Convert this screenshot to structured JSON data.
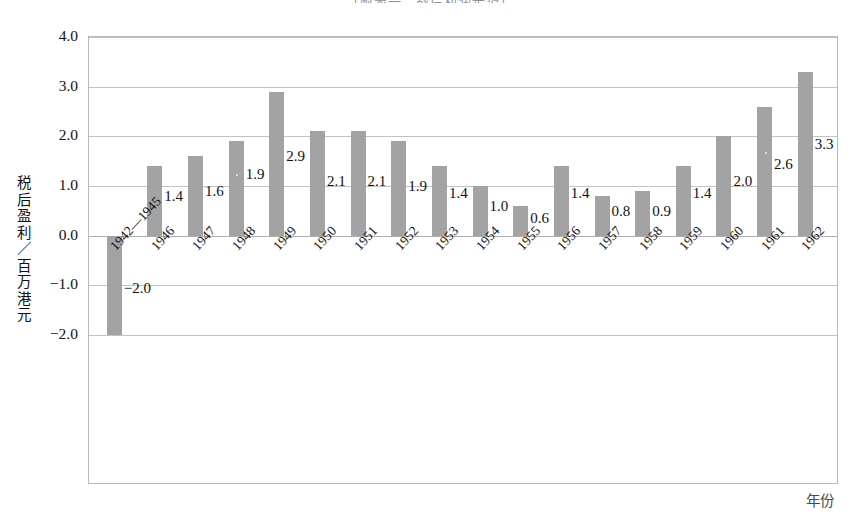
{
  "chart_data": {
    "type": "bar",
    "title": "（附表一：战后利润走势）",
    "xlabel": "年份",
    "ylabel": "税后盈利／百万港元",
    "ylabel_chars": [
      "税",
      "后",
      "盈",
      "利",
      "／",
      "百",
      "万",
      "港",
      "元"
    ],
    "ylim": [
      -2.0,
      4.0
    ],
    "yticks": [
      "4.0",
      "3.0",
      "2.0",
      "1.0",
      "0.0",
      "-1.0",
      "-2.0"
    ],
    "ytick_values": [
      4.0,
      3.0,
      2.0,
      1.0,
      0.0,
      -1.0,
      -2.0
    ],
    "grid": true,
    "legend": "none",
    "bar_color": "#a3a3a3",
    "categories": [
      "1942—1945",
      "1946",
      "1947",
      "1948",
      "1949",
      "1950",
      "1951",
      "1952",
      "1953",
      "1954",
      "1955",
      "1956",
      "1957",
      "1958",
      "1959",
      "1960",
      "1961",
      "1962"
    ],
    "values": [
      -2.0,
      1.4,
      1.6,
      1.9,
      2.9,
      2.1,
      2.1,
      1.9,
      1.4,
      1.0,
      0.6,
      1.4,
      0.8,
      0.9,
      1.4,
      2.0,
      2.6,
      3.3
    ],
    "data_labels": [
      "-2.0",
      "1.4",
      "1.6",
      "1.9",
      "2.9",
      "2.1",
      "2.1",
      "1.9",
      "1.4",
      "1.0",
      "0.6",
      "1.4",
      "0.8",
      "0.9",
      "1.4",
      "2.0",
      "2.6",
      "3.3"
    ],
    "label_offsets_y": [
      -1.05,
      0.8,
      0.9,
      1.25,
      1.6,
      1.1,
      1.1,
      1.0,
      0.85,
      0.6,
      0.35,
      0.85,
      0.5,
      0.5,
      0.85,
      1.1,
      1.45,
      1.85
    ],
    "speck_bars": [
      3,
      16
    ]
  }
}
